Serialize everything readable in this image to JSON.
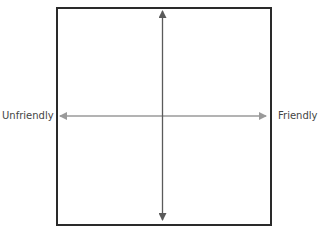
{
  "diagram": {
    "type": "quadrant",
    "clipped_top_text": "",
    "axes": {
      "horizontal": {
        "left_label": "Unfriendly",
        "right_label": "Friendly",
        "color": "#9a9a9a"
      },
      "vertical": {
        "top_label": "",
        "bottom_label": "",
        "color": "#5a5a5a"
      }
    },
    "frame_color": "#2a2a2a"
  }
}
